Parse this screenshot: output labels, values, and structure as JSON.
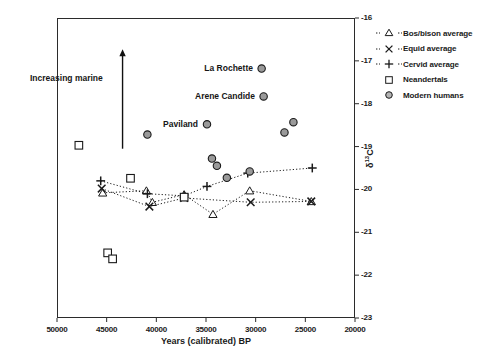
{
  "chart_data": {
    "type": "scatter",
    "title": "",
    "xlabel": "Years (calibrated) BP",
    "ylabel": "δ¹³C",
    "ylabel_base": "δ",
    "ylabel_sup": "13",
    "ylabel_tail": "C",
    "xlim": [
      50000,
      20000
    ],
    "ylim": [
      -23,
      -16
    ],
    "x_inverted": true,
    "grid": false,
    "legend_position": "right-outside-top",
    "xticks": [
      50000,
      45000,
      40000,
      35000,
      30000,
      25000,
      20000
    ],
    "xticklabels": [
      "50000",
      "45000",
      "40000",
      "35000",
      "30000",
      "25000",
      "20000"
    ],
    "yticks": [
      -16,
      -17,
      -18,
      -19,
      -20,
      -21,
      -22,
      -23
    ],
    "yticklabels": [
      "-16",
      "-17",
      "-18",
      "-19",
      "-20",
      "-21",
      "-22",
      "-23"
    ],
    "annotations": [
      {
        "text": "Increasing marine",
        "x": 46200,
        "y": -17.05,
        "kind": "text"
      },
      {
        "text": "La Rochette",
        "x": 30600,
        "y": -17.18,
        "kind": "point-label"
      },
      {
        "text": "Arene Candide",
        "x": 30900,
        "y": -17.83,
        "kind": "point-label"
      },
      {
        "text": "Paviland",
        "x": 36100,
        "y": -18.48,
        "kind": "point-label"
      },
      {
        "text": "arrow-up",
        "x": 43400,
        "y_from": -19.05,
        "y_to": -16.75,
        "kind": "arrow"
      }
    ],
    "series": [
      {
        "name": "Bos/bison average",
        "marker": "triangle-open",
        "line": "dotted",
        "points": [
          {
            "x": 45400,
            "y": -20.08
          },
          {
            "x": 41000,
            "y": -20.03
          },
          {
            "x": 40400,
            "y": -20.3
          },
          {
            "x": 37200,
            "y": -20.12
          },
          {
            "x": 34300,
            "y": -20.58
          },
          {
            "x": 30600,
            "y": -20.03
          },
          {
            "x": 24400,
            "y": -20.28
          }
        ]
      },
      {
        "name": "Equid average",
        "marker": "x-cross",
        "line": "dotted",
        "points": [
          {
            "x": 45500,
            "y": -19.98
          },
          {
            "x": 40700,
            "y": -20.4
          },
          {
            "x": 37200,
            "y": -20.2
          },
          {
            "x": 30500,
            "y": -20.3
          },
          {
            "x": 24400,
            "y": -20.28
          }
        ]
      },
      {
        "name": "Cervid average",
        "marker": "plus",
        "line": "dotted",
        "points": [
          {
            "x": 45600,
            "y": -19.8
          },
          {
            "x": 40900,
            "y": -20.1
          },
          {
            "x": 37200,
            "y": -20.15
          },
          {
            "x": 34900,
            "y": -19.93
          },
          {
            "x": 30800,
            "y": -19.62
          },
          {
            "x": 24300,
            "y": -19.5
          }
        ]
      },
      {
        "name": "Neandertals",
        "marker": "square-open",
        "line": "none",
        "points": [
          {
            "x": 47800,
            "y": -18.97
          },
          {
            "x": 42600,
            "y": -19.74
          },
          {
            "x": 37200,
            "y": -20.18
          },
          {
            "x": 44900,
            "y": -21.48
          },
          {
            "x": 44400,
            "y": -21.62
          }
        ]
      },
      {
        "name": "Modern humans",
        "marker": "circle-filled",
        "line": "none",
        "points": [
          {
            "x": 29400,
            "y": -17.18,
            "label": "La Rochette"
          },
          {
            "x": 29200,
            "y": -17.83,
            "label": "Arene Candide"
          },
          {
            "x": 34900,
            "y": -18.48,
            "label": "Paviland"
          },
          {
            "x": 40900,
            "y": -18.72
          },
          {
            "x": 34400,
            "y": -19.28
          },
          {
            "x": 33900,
            "y": -19.45
          },
          {
            "x": 32900,
            "y": -19.73
          },
          {
            "x": 27100,
            "y": -18.67
          },
          {
            "x": 26200,
            "y": -18.43
          },
          {
            "x": 30600,
            "y": -19.58
          }
        ]
      }
    ]
  },
  "legend": {
    "items": [
      {
        "label": "Bos/bison average",
        "marker": "triangle-open",
        "line": "dotted"
      },
      {
        "label": "Equid average",
        "marker": "x-cross",
        "line": "dotted"
      },
      {
        "label": "Cervid average",
        "marker": "plus",
        "line": "dotted"
      },
      {
        "label": "Neandertals",
        "marker": "square-open",
        "line": "none"
      },
      {
        "label": "Modern humans",
        "marker": "circle-filled",
        "line": "none"
      }
    ]
  },
  "colors": {
    "axis": "#2b2b2b",
    "marker_stroke": "#1a1a1a",
    "circle_fill": "#9a9a9a",
    "text": "#1a1a1a",
    "background": "#ffffff"
  }
}
